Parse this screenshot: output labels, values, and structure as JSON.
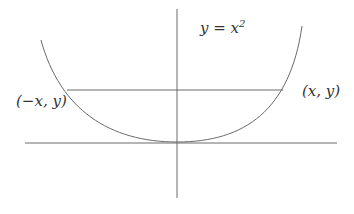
{
  "diagram": {
    "equation_label": {
      "text": "y = x",
      "exponent": "2"
    },
    "points": [
      {
        "label": "(−x, y)",
        "position": "left"
      },
      {
        "label": "(x, y)",
        "position": "right"
      }
    ],
    "colors": {
      "curve": "#6a6a6a",
      "axis": "#6a6a6a",
      "text": "#333333",
      "background": "#ffffff"
    },
    "elements": {
      "parabola": {
        "vertex": [
          177,
          142
        ],
        "left_end": [
          41,
          40
        ],
        "right_end": [
          302,
          26
        ]
      },
      "chord": {
        "y": 90,
        "x_start": 67,
        "x_end": 283
      },
      "x_axis": {
        "y": 143,
        "x_start": 25,
        "x_end": 337
      },
      "y_axis": {
        "x": 177,
        "y_start": 9,
        "y_end": 198
      }
    }
  }
}
